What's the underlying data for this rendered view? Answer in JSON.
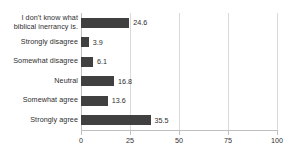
{
  "chart_data": {
    "type": "bar",
    "orientation": "horizontal",
    "title": "",
    "xlabel": "",
    "ylabel": "",
    "xlim": [
      0,
      100
    ],
    "grid": true,
    "legend": false,
    "bar_color": "#404040",
    "categories": [
      "I don't know what biblical inerrancy is.",
      "Strongly disagree",
      "Somewhat disagree",
      "Neutral",
      "Somewhat agree",
      "Strongly agree"
    ],
    "category_lines": [
      [
        "I don't know what",
        "biblical inerrancy is."
      ],
      [
        "Strongly disagree"
      ],
      [
        "Somewhat disagree"
      ],
      [
        "Neutral"
      ],
      [
        "Somewhat agree"
      ],
      [
        "Strongly agree"
      ]
    ],
    "values": [
      24.6,
      3.9,
      6.1,
      16.8,
      13.6,
      35.5
    ],
    "value_labels": [
      "24.6",
      "3.9",
      "6.1",
      "16.8",
      "13.6",
      "35.5"
    ],
    "xticks": [
      0,
      25,
      50,
      75,
      100
    ],
    "xtick_labels": [
      "0",
      "25",
      "50",
      "75",
      "100"
    ]
  }
}
